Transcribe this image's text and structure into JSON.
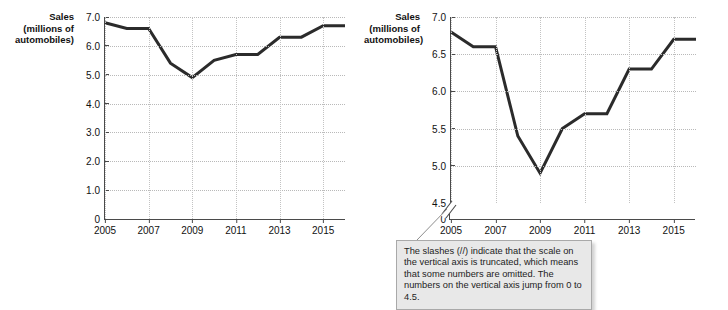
{
  "figure": {
    "callout": {
      "text": "The slashes (//) indicate that the scale on the vertical axis is truncated, which means that some numbers are omitted.  The numbers on the vertical axis jump from 0 to 4.5."
    }
  },
  "chart_data": [
    {
      "id": "left",
      "type": "line",
      "title": "",
      "ylabel_lines": [
        "Sales",
        "(millions of",
        "automobiles)"
      ],
      "ylabel": "Sales (millions of automobiles)",
      "xlabel": "",
      "x": [
        2005,
        2006,
        2007,
        2008,
        2009,
        2010,
        2011,
        2012,
        2013,
        2014,
        2015,
        2016
      ],
      "values": [
        6.8,
        6.6,
        6.6,
        5.4,
        4.9,
        5.5,
        5.7,
        5.7,
        6.3,
        6.3,
        6.7,
        6.7
      ],
      "xticks": [
        "2005",
        "2007",
        "2009",
        "2011",
        "2013",
        "2015"
      ],
      "xtick_values": [
        2005,
        2007,
        2009,
        2011,
        2013,
        2015
      ],
      "yticks": [
        "0",
        "1.0",
        "2.0",
        "3.0",
        "4.0",
        "5.0",
        "6.0",
        "7.0"
      ],
      "ytick_values": [
        0,
        1,
        2,
        3,
        4,
        5,
        6,
        7
      ],
      "ylim": [
        0,
        7
      ],
      "xlim": [
        2005,
        2016
      ],
      "axis_truncated": false,
      "grid": true,
      "legend": "none",
      "line_color": "#2b2b2b"
    },
    {
      "id": "right",
      "type": "line",
      "title": "",
      "ylabel_lines": [
        "Sales",
        "(millions of",
        "automobiles)"
      ],
      "ylabel": "Sales (millions of automobiles)",
      "xlabel": "",
      "x": [
        2005,
        2006,
        2007,
        2008,
        2009,
        2010,
        2011,
        2012,
        2013,
        2014,
        2015,
        2016
      ],
      "values": [
        6.8,
        6.6,
        6.6,
        5.4,
        4.9,
        5.5,
        5.7,
        5.7,
        6.3,
        6.3,
        6.7,
        6.7
      ],
      "xticks": [
        "2005",
        "2007",
        "2009",
        "2011",
        "2013",
        "2015"
      ],
      "xtick_values": [
        2005,
        2007,
        2009,
        2011,
        2013,
        2015
      ],
      "yticks": [
        "0",
        "4.5",
        "5.0",
        "5.5",
        "6.0",
        "6.5",
        "7.0"
      ],
      "ytick_values": [
        0,
        4.5,
        5.0,
        5.5,
        6.0,
        6.5,
        7.0
      ],
      "ylim": [
        4.5,
        7.0
      ],
      "xlim": [
        2005,
        2016
      ],
      "axis_truncated": true,
      "axis_break_label": "//",
      "grid": true,
      "legend": "none",
      "line_color": "#2b2b2b"
    }
  ]
}
